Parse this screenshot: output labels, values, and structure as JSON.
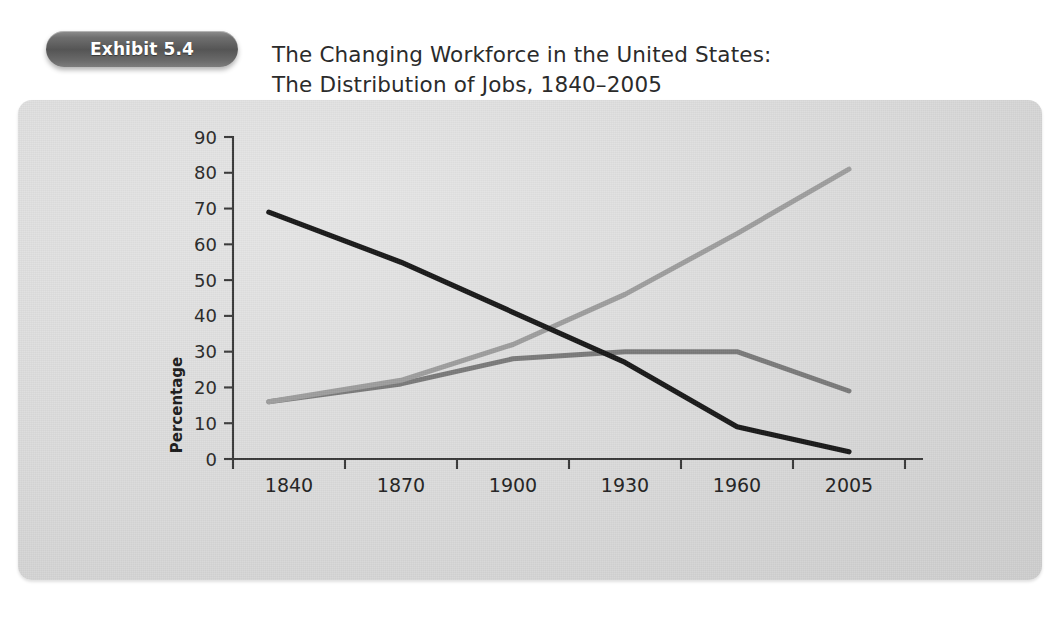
{
  "badge": {
    "label": "Exhibit 5.4"
  },
  "title": {
    "line1": "The Changing Workforce in the United States:",
    "line2": "The Distribution of Jobs, 1840–2005"
  },
  "colors": {
    "panel_light": "#e7e7e7",
    "panel_dark": "#c9c9c9",
    "badge": "#555555",
    "axis": "#3a3a3a",
    "manufacturing": "#7b7b7b",
    "service": "#9e9e9e",
    "extractive": "#1a1a1a"
  },
  "axes": {
    "y_label": "Percentage",
    "y_ticks": [
      "0",
      "10",
      "20",
      "30",
      "40",
      "50",
      "60",
      "70",
      "80",
      "90"
    ],
    "x_ticks": [
      "1840",
      "1870",
      "1900",
      "1930",
      "1960",
      "2005"
    ]
  },
  "legend": {
    "items": [
      {
        "label": "Manufacturing",
        "color": "#7b7b7b"
      },
      {
        "label": "Service",
        "color": "#9e9e9e"
      },
      {
        "label": "Extractive",
        "color": "#1a1a1a"
      }
    ]
  },
  "chart_data": {
    "type": "line",
    "title": "The Changing Workforce in the United States: The Distribution of Jobs, 1840–2005",
    "xlabel": "",
    "ylabel": "Percentage",
    "categories": [
      "1840",
      "1870",
      "1900",
      "1930",
      "1960",
      "2005"
    ],
    "ylim": [
      0,
      90
    ],
    "ytick_step": 10,
    "grid": false,
    "legend_position": "bottom",
    "series": [
      {
        "name": "Manufacturing",
        "color": "#7b7b7b",
        "values": [
          16,
          21,
          28,
          30,
          30,
          19
        ]
      },
      {
        "name": "Service",
        "color": "#9e9e9e",
        "values": [
          16,
          22,
          32,
          46,
          63,
          81
        ]
      },
      {
        "name": "Extractive",
        "color": "#1a1a1a",
        "values": [
          69,
          55,
          41,
          27,
          9,
          2
        ]
      }
    ]
  }
}
